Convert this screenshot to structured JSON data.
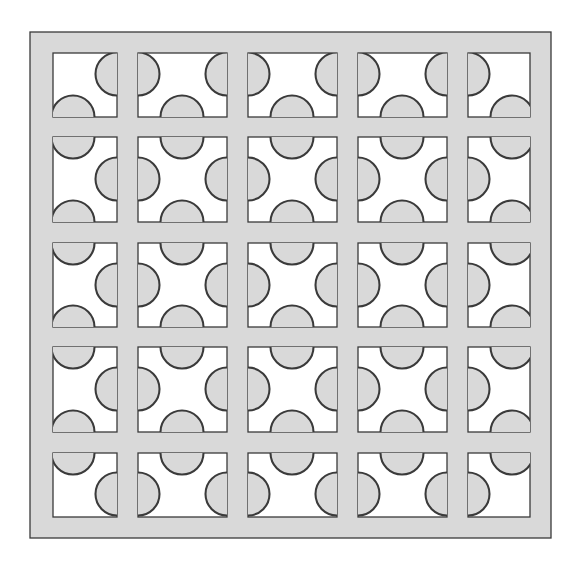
{
  "figure": {
    "rows": 5,
    "cols": 5
  },
  "colors": {
    "background": "#ffffff",
    "panel_fill": "#d9d9d9",
    "opening_fill": "#ffffff",
    "stroke": "#3a3a3a"
  },
  "geometry": {
    "canvas": [
      580,
      565
    ],
    "outer_frame": {
      "x0": 30,
      "y0": 32,
      "x1": 551,
      "y1": 538
    },
    "col_bounds": [
      [
        53,
        117
      ],
      [
        138,
        227
      ],
      [
        248,
        337
      ],
      [
        358,
        447
      ],
      [
        468,
        530
      ]
    ],
    "row_bounds": [
      [
        53,
        117
      ],
      [
        137,
        222
      ],
      [
        243,
        327
      ],
      [
        347,
        432
      ],
      [
        453,
        517
      ]
    ],
    "bite_centers_x": [
      73,
      182,
      292,
      402,
      512
    ],
    "bite_centers_y": [
      74,
      179,
      285,
      389,
      494
    ],
    "bite_radius": 21.5,
    "stroke_width": 1.3
  }
}
